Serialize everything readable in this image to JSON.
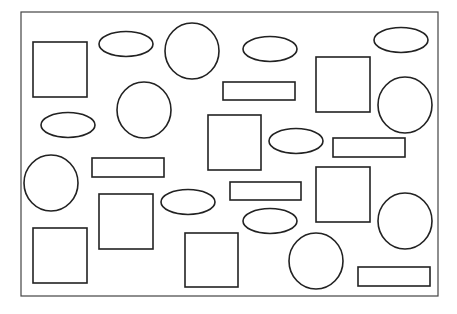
{
  "figure": {
    "width": 457,
    "height": 314,
    "background": "#ffffff",
    "stroke": "#222222",
    "stroke_width": 1.6,
    "frame": {
      "x": 21,
      "y": 12,
      "w": 417,
      "h": 284
    },
    "squares": [
      {
        "x": 33,
        "y": 42,
        "w": 54,
        "h": 55
      },
      {
        "x": 316,
        "y": 57,
        "w": 54,
        "h": 55
      },
      {
        "x": 208,
        "y": 115,
        "w": 53,
        "h": 55
      },
      {
        "x": 316,
        "y": 167,
        "w": 54,
        "h": 55
      },
      {
        "x": 99,
        "y": 194,
        "w": 54,
        "h": 55
      },
      {
        "x": 33,
        "y": 228,
        "w": 54,
        "h": 55
      },
      {
        "x": 185,
        "y": 233,
        "w": 53,
        "h": 54
      }
    ],
    "bars": [
      {
        "x": 223,
        "y": 82,
        "w": 72,
        "h": 18
      },
      {
        "x": 333,
        "y": 138,
        "w": 72,
        "h": 19
      },
      {
        "x": 92,
        "y": 158,
        "w": 72,
        "h": 19
      },
      {
        "x": 230,
        "y": 182,
        "w": 71,
        "h": 18
      },
      {
        "x": 358,
        "y": 267,
        "w": 72,
        "h": 19
      }
    ],
    "circles": [
      {
        "cx": 192,
        "cy": 51,
        "rx": 27,
        "ry": 28
      },
      {
        "cx": 144,
        "cy": 110,
        "rx": 27,
        "ry": 28
      },
      {
        "cx": 405,
        "cy": 105,
        "rx": 27,
        "ry": 28
      },
      {
        "cx": 51,
        "cy": 183,
        "rx": 27,
        "ry": 28
      },
      {
        "cx": 405,
        "cy": 221,
        "rx": 27,
        "ry": 28
      },
      {
        "cx": 316,
        "cy": 261,
        "rx": 27,
        "ry": 28
      }
    ],
    "ellipses": [
      {
        "cx": 126,
        "cy": 44,
        "rx": 27,
        "ry": 12.5
      },
      {
        "cx": 401,
        "cy": 40,
        "rx": 27,
        "ry": 12.5
      },
      {
        "cx": 270,
        "cy": 49,
        "rx": 27,
        "ry": 12.5
      },
      {
        "cx": 68,
        "cy": 125,
        "rx": 27,
        "ry": 12.5
      },
      {
        "cx": 296,
        "cy": 141,
        "rx": 27,
        "ry": 12.5
      },
      {
        "cx": 188,
        "cy": 202,
        "rx": 27,
        "ry": 12.5
      },
      {
        "cx": 270,
        "cy": 221,
        "rx": 27,
        "ry": 12.5
      }
    ]
  }
}
